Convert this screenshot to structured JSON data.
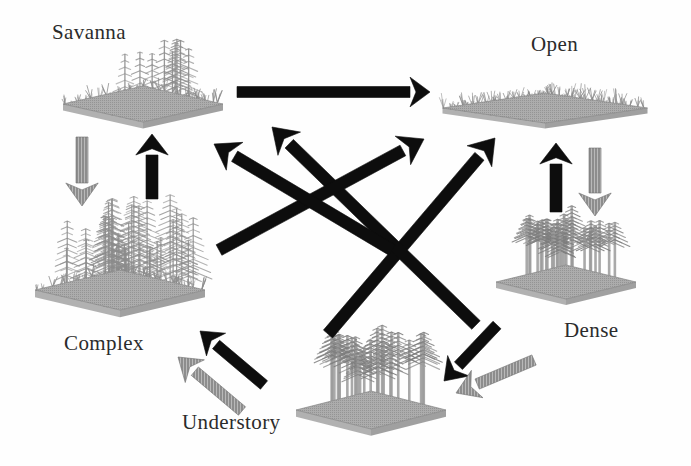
{
  "figure": {
    "type": "state-transition-diagram",
    "background_color": "#fefefe",
    "text_color": "#2b2b2b",
    "solid_arrow_color": "#0d0d0d",
    "hatched_arrow_color": "#8a8a8a",
    "patch_color": "#8c8c8c",
    "patch_base_color": "#9a9a9a"
  },
  "states": [
    {
      "id": "savanna",
      "label": "Savanna",
      "label_x": 52,
      "label_y": 20,
      "patch": {
        "cx": 143,
        "cy": 104,
        "w": 160,
        "h": 36,
        "type": "savanna",
        "tree_count": 9,
        "tree_height": 58,
        "shrub": true
      }
    },
    {
      "id": "open",
      "label": "Open",
      "label_x": 531,
      "label_y": 32,
      "patch": {
        "cx": 545,
        "cy": 108,
        "w": 205,
        "h": 30,
        "type": "open",
        "tree_count": 0,
        "tree_height": 0,
        "shrub": true
      }
    },
    {
      "id": "complex",
      "label": "Complex",
      "label_x": 64,
      "label_y": 331,
      "patch": {
        "cx": 120,
        "cy": 290,
        "w": 170,
        "h": 40,
        "type": "complex",
        "tree_count": 34,
        "tree_height": 86,
        "shrub": true
      }
    },
    {
      "id": "understory",
      "label": "Understory",
      "label_x": 182,
      "label_y": 410,
      "patch": {
        "cx": 371,
        "cy": 410,
        "w": 150,
        "h": 38,
        "type": "understory",
        "tree_count": 26,
        "tree_height": 74,
        "shrub": false
      }
    },
    {
      "id": "dense",
      "label": "Dense",
      "label_x": 564,
      "label_y": 318,
      "patch": {
        "cx": 566,
        "cy": 282,
        "w": 140,
        "h": 34,
        "type": "dense",
        "tree_count": 26,
        "tree_height": 62,
        "shrub": false
      }
    }
  ],
  "transitions": [
    {
      "id": "savanna-to-open",
      "from": "savanna",
      "to": "open",
      "style": "solid",
      "x1": 237,
      "y1": 92,
      "x2": 430,
      "y2": 92,
      "width": 11,
      "head": 20
    },
    {
      "id": "savanna-to-complex",
      "from": "savanna",
      "to": "complex",
      "style": "hatched",
      "x1": 82,
      "y1": 137,
      "x2": 82,
      "y2": 206,
      "width": 12,
      "head": 23
    },
    {
      "id": "complex-to-savanna",
      "from": "complex",
      "to": "savanna",
      "style": "solid",
      "x1": 152,
      "y1": 199,
      "x2": 152,
      "y2": 134,
      "width": 12,
      "head": 21
    },
    {
      "id": "open-to-dense",
      "from": "open",
      "to": "dense",
      "style": "hatched",
      "x1": 595,
      "y1": 148,
      "x2": 595,
      "y2": 216,
      "width": 12,
      "head": 23
    },
    {
      "id": "dense-to-open",
      "from": "dense",
      "to": "open",
      "style": "solid",
      "x1": 556,
      "y1": 212,
      "x2": 556,
      "y2": 143,
      "width": 12,
      "head": 21
    },
    {
      "id": "understory-to-complex",
      "from": "understory",
      "to": "complex",
      "style": "solid",
      "x1": 264,
      "y1": 385,
      "x2": 200,
      "y2": 331,
      "width": 11,
      "head": 21
    },
    {
      "id": "complex-to-understory",
      "from": "complex",
      "to": "understory",
      "style": "hatched",
      "x1": 242,
      "y1": 411,
      "x2": 178,
      "y2": 357,
      "width": 11,
      "head": 22
    },
    {
      "id": "understory-to-dense",
      "from": "understory",
      "to": "dense",
      "style": "solid",
      "x1": 497,
      "y1": 325,
      "x2": 444,
      "y2": 381,
      "width": 11,
      "head": 21
    },
    {
      "id": "dense-to-understory",
      "from": "dense",
      "to": "understory",
      "style": "hatched",
      "x1": 534,
      "y1": 360,
      "x2": 456,
      "y2": 393,
      "width": 11,
      "head": 23
    },
    {
      "id": "understory-to-open",
      "from": "understory",
      "to": "open",
      "style": "solid",
      "x1": 328,
      "y1": 334,
      "x2": 495,
      "y2": 138,
      "width": 12,
      "head": 24
    },
    {
      "id": "dense-to-savanna",
      "from": "dense",
      "to": "savanna",
      "style": "solid",
      "x1": 476,
      "y1": 325,
      "x2": 272,
      "y2": 127,
      "width": 12,
      "head": 24
    },
    {
      "id": "complex-to-open",
      "from": "complex",
      "to": "open",
      "style": "solid",
      "x1": 219,
      "y1": 250,
      "x2": 424,
      "y2": 139,
      "width": 12,
      "head": 24
    },
    {
      "id": "open-to-complex",
      "from": "open",
      "to": "complex",
      "style": "solid",
      "x1": 392,
      "y1": 250,
      "x2": 214,
      "y2": 144,
      "width": 12,
      "head": 24
    }
  ],
  "legend": {
    "solid_meaning": "disturbance / transition",
    "hatched_meaning": "succession / growth"
  }
}
